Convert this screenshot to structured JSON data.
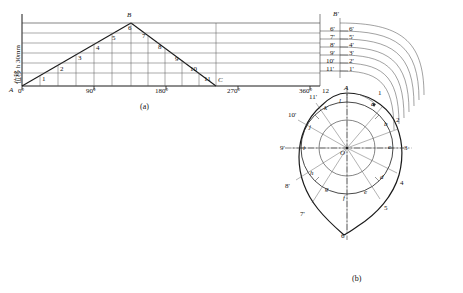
{
  "figure": {
    "captions": [
      {
        "id": "cap-a",
        "text": "(a)",
        "x": 140,
        "y": 106
      },
      {
        "id": "cap-b",
        "text": "(b)",
        "x": 352,
        "y": 278
      }
    ],
    "axis_label_vertical": "位移 h 30mm",
    "axis_label_vertical_plain": "位移 h 30mm"
  },
  "displacement_diagram": {
    "name": "displacement-diagram",
    "x_axis_ticks": [
      {
        "label": "0°",
        "x": 20,
        "y": 88
      },
      {
        "label": "90°",
        "x": 88,
        "y": 88
      },
      {
        "label": "180°",
        "x": 155,
        "y": 88
      },
      {
        "label": "270°",
        "x": 222,
        "y": 88
      },
      {
        "label": "360°",
        "x": 290,
        "y": 88
      }
    ],
    "corner_labels": [
      {
        "label": "A",
        "x": 10,
        "y": 88
      },
      {
        "label": "B",
        "x": 124,
        "y": 14
      },
      {
        "label": "C",
        "x": 215,
        "y": 88
      }
    ],
    "division_numbers": [
      {
        "label": "1",
        "x": 43,
        "y": 76
      },
      {
        "label": "2",
        "x": 61,
        "y": 64
      },
      {
        "label": "3",
        "x": 79,
        "y": 54
      },
      {
        "label": "4",
        "x": 97,
        "y": 44
      },
      {
        "label": "5",
        "x": 112,
        "y": 37
      },
      {
        "label": "6",
        "x": 126,
        "y": 30
      },
      {
        "label": "7",
        "x": 140,
        "y": 37
      },
      {
        "label": "8",
        "x": 157,
        "y": 44
      },
      {
        "label": "9",
        "x": 175,
        "y": 54
      },
      {
        "label": "10",
        "x": 190,
        "y": 66
      },
      {
        "label": "11",
        "x": 205,
        "y": 76
      }
    ],
    "right_tick_labels": [
      {
        "label": "B'",
        "x": 334,
        "y": 14
      },
      {
        "label": "6'",
        "x": 330,
        "y": 30
      },
      {
        "label": "7'",
        "x": 330,
        "y": 38
      },
      {
        "label": "8'",
        "x": 330,
        "y": 46
      },
      {
        "label": "9'",
        "x": 330,
        "y": 54
      },
      {
        "label": "10'",
        "x": 327,
        "y": 62
      },
      {
        "label": "11'",
        "x": 327,
        "y": 70
      },
      {
        "label": "6'",
        "x": 349,
        "y": 30
      },
      {
        "label": "5'",
        "x": 349,
        "y": 38
      },
      {
        "label": "4'",
        "x": 349,
        "y": 46
      },
      {
        "label": "3'",
        "x": 349,
        "y": 54
      },
      {
        "label": "2'",
        "x": 349,
        "y": 62
      },
      {
        "label": "1'",
        "x": 349,
        "y": 70
      }
    ]
  },
  "cam_diagram": {
    "name": "cam-profile-diagram",
    "center_label": "O",
    "top_label": "A",
    "outer_numbers": [
      {
        "label": "1",
        "x": 386,
        "y": 92
      },
      {
        "label": "2",
        "x": 406,
        "y": 119
      },
      {
        "label": "3",
        "x": 412,
        "y": 148
      },
      {
        "label": "4",
        "x": 406,
        "y": 182
      },
      {
        "label": "5",
        "x": 390,
        "y": 207
      },
      {
        "label": "6'",
        "x": 344,
        "y": 236
      },
      {
        "label": "7'",
        "x": 302,
        "y": 213
      },
      {
        "label": "8'",
        "x": 286,
        "y": 185
      },
      {
        "label": "9'",
        "x": 281,
        "y": 148
      },
      {
        "label": "10'",
        "x": 290,
        "y": 115
      },
      {
        "label": "11'",
        "x": 311,
        "y": 96
      },
      {
        "label": "12",
        "x": 322,
        "y": 90
      }
    ],
    "inner_letters": [
      {
        "label": "a",
        "x": 372,
        "y": 104
      },
      {
        "label": "b",
        "x": 385,
        "y": 124
      },
      {
        "label": "c",
        "x": 390,
        "y": 148
      },
      {
        "label": "d",
        "x": 382,
        "y": 177
      },
      {
        "label": "e",
        "x": 366,
        "y": 192
      },
      {
        "label": "f",
        "x": 344,
        "y": 198
      },
      {
        "label": "g",
        "x": 326,
        "y": 190
      },
      {
        "label": "h",
        "x": 311,
        "y": 173
      },
      {
        "label": "i",
        "x": 303,
        "y": 148
      },
      {
        "label": "j",
        "x": 310,
        "y": 127
      },
      {
        "label": "k",
        "x": 325,
        "y": 108
      },
      {
        "label": "l",
        "x": 340,
        "y": 101
      }
    ]
  },
  "colors": {
    "line": "#1a1a1a",
    "thin": "#444444",
    "background": "#ffffff"
  }
}
